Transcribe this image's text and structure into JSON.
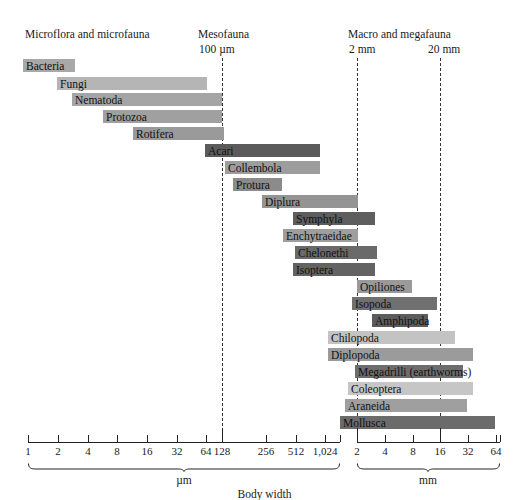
{
  "chart_data": {
    "type": "bar",
    "title": "",
    "xlabel": "Body width",
    "ylabel": "",
    "grid": false,
    "legend_position": "none",
    "orientation": "horizontal-ranges",
    "axis": {
      "left_unit": "µm",
      "right_unit": "mm",
      "left_ticks": [
        "1",
        "2",
        "4",
        "8",
        "16",
        "32",
        "64",
        "128",
        "256",
        "512",
        "1,024"
      ],
      "right_ticks": [
        "2",
        "4",
        "8",
        "16",
        "32",
        "64"
      ],
      "scale": "log2",
      "boundary_100um": "128",
      "boundary_2mm": "2",
      "boundary_20mm": "16"
    },
    "groups": [
      {
        "name": "Microflora and microfauna",
        "sub": "",
        "x": 25,
        "sub_x": 0
      },
      {
        "name": "Mesofauna",
        "sub": "100 µm",
        "x": 198,
        "sub_x": 199
      },
      {
        "name": "Macro and megafauna",
        "sub": "",
        "x": 348,
        "sub_x": 0
      },
      {
        "name": "",
        "sub": "2 mm",
        "x": 0,
        "sub_x": 349
      },
      {
        "name": "",
        "sub": "20 mm",
        "x": 0,
        "sub_x": 428
      }
    ],
    "boundaries": [
      {
        "name": "100 um",
        "x": 222
      },
      {
        "name": "2 mm",
        "x": 357
      },
      {
        "name": "20 mm",
        "x": 440
      }
    ],
    "taxa": [
      {
        "label": "Bacteria",
        "start": 23,
        "end": 75,
        "color": "#a8a8a8",
        "label_pos": "inside",
        "y": 59
      },
      {
        "label": "Fungi",
        "start": 57,
        "end": 207,
        "color": "#b5b5b5",
        "label_pos": "inside",
        "y": 77
      },
      {
        "label": "Nematoda",
        "start": 72,
        "end": 222,
        "color": "#a5a5a5",
        "label_pos": "inside",
        "y": 93
      },
      {
        "label": "Protozoa",
        "start": 103,
        "end": 222,
        "color": "#a0a0a0",
        "label_pos": "inside",
        "y": 110
      },
      {
        "label": "Rotifera",
        "start": 133,
        "end": 224,
        "color": "#9a9a9a",
        "label_pos": "inside",
        "y": 127
      },
      {
        "label": "Acari",
        "start": 205,
        "end": 320,
        "color": "#5b5b5b",
        "label_pos": "inside",
        "y": 144
      },
      {
        "label": "Collembola",
        "start": 225,
        "end": 320,
        "color": "#9d9d9d",
        "label_pos": "inside",
        "y": 161
      },
      {
        "label": "Protura",
        "start": 233,
        "end": 282,
        "color": "#8b8b8b",
        "label_pos": "inside",
        "y": 178
      },
      {
        "label": "Diplura",
        "start": 262,
        "end": 358,
        "color": "#949494",
        "label_pos": "inside",
        "y": 195
      },
      {
        "label": "Symphyla",
        "start": 293,
        "end": 375,
        "color": "#5e5e5e",
        "label_pos": "inside",
        "y": 212
      },
      {
        "label": "Enchytraeidae",
        "start": 283,
        "end": 358,
        "color": "#9e9e9e",
        "label_pos": "inside",
        "y": 229
      },
      {
        "label": "Chelonethi",
        "start": 295,
        "end": 377,
        "color": "#6a6a6a",
        "label_pos": "inside",
        "y": 246
      },
      {
        "label": "Isoptera",
        "start": 293,
        "end": 375,
        "color": "#636363",
        "label_pos": "inside",
        "y": 263
      },
      {
        "label": "Opiliones",
        "start": 357,
        "end": 412,
        "color": "#9a9a9a",
        "label_pos": "inside",
        "y": 280
      },
      {
        "label": "Isopoda",
        "start": 352,
        "end": 437,
        "color": "#707070",
        "label_pos": "inside",
        "y": 297
      },
      {
        "label": "Amphipoda",
        "start": 372,
        "end": 428,
        "color": "#5c5c5c",
        "label_pos": "inside",
        "y": 314
      },
      {
        "label": "Chilopoda",
        "start": 328,
        "end": 455,
        "color": "#c3c3c3",
        "label_pos": "inside",
        "y": 331
      },
      {
        "label": "Diplopoda",
        "start": 328,
        "end": 473,
        "color": "#9b9b9b",
        "label_pos": "inside",
        "y": 348
      },
      {
        "label": "Megadrilli (earthworms)",
        "start": 355,
        "end": 463,
        "color": "#6d6d6d",
        "label_pos": "inside",
        "y": 365
      },
      {
        "label": "Coleoptera",
        "start": 348,
        "end": 473,
        "color": "#c6c6c6",
        "label_pos": "inside",
        "y": 382
      },
      {
        "label": "Araneida",
        "start": 345,
        "end": 467,
        "color": "#9f9f9f",
        "label_pos": "inside",
        "y": 399
      },
      {
        "label": "Mollusca",
        "start": 340,
        "end": 495,
        "color": "#6b6b6b",
        "label_pos": "inside",
        "y": 416
      }
    ]
  },
  "axis_render": {
    "left_start_x": 28,
    "left_end_x": 340,
    "right_start_x": 357,
    "right_end_x": 500,
    "left_tick_positions": [
      28,
      58,
      88,
      117,
      147,
      177,
      206,
      222,
      266,
      296,
      325
    ],
    "left_tick_labels": [
      "1",
      "2",
      "4",
      "8",
      "16",
      "32",
      "64",
      "128",
      "256",
      "512",
      "1,024"
    ],
    "right_tick_positions": [
      357,
      385,
      413,
      440,
      468,
      496
    ],
    "right_tick_labels": [
      "2",
      "4",
      "8",
      "16",
      "32",
      "64"
    ],
    "left_unit": "µm",
    "right_unit": "mm",
    "left_unit_x": 184,
    "right_unit_x": 428,
    "title": "Body width"
  }
}
